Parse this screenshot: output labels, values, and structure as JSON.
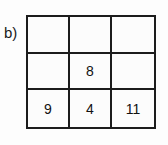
{
  "figure": {
    "part_label": "b)",
    "grid": {
      "rows": 3,
      "columns": 3,
      "line_color": "#1c1c1c",
      "background_color": "#fcfcfc",
      "text_color": "#111111",
      "cells": [
        [
          {
            "value": "",
            "empty": true
          },
          {
            "value": "",
            "empty": true
          },
          {
            "value": "",
            "empty": true
          }
        ],
        [
          {
            "value": "",
            "empty": true
          },
          {
            "value": "8",
            "empty": false
          },
          {
            "value": "",
            "empty": true
          }
        ],
        [
          {
            "value": "9",
            "empty": false
          },
          {
            "value": "4",
            "empty": false
          },
          {
            "value": "11",
            "empty": false
          }
        ]
      ]
    }
  }
}
